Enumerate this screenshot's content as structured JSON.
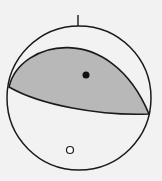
{
  "diagram": {
    "type": "focal-mechanism-beachball",
    "background": "#f2f2f2",
    "compressional_fill": "#b8b8b8",
    "line_color": "#1a1a1a",
    "north_tick": true,
    "p_axis_marker": "filled-dot",
    "t_axis_marker": "open-dot"
  }
}
